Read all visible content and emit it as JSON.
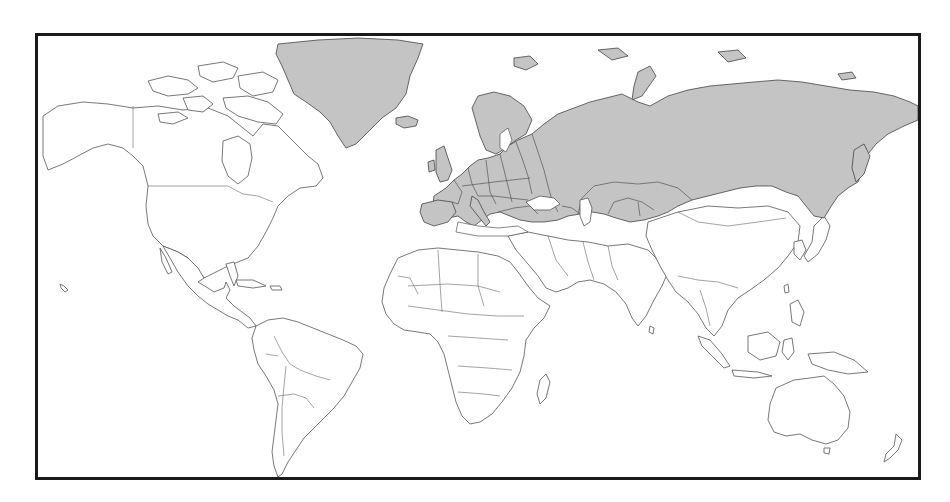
{
  "map": {
    "type": "world-political-outline",
    "projection": "miller-cylindrical",
    "colors": {
      "highlight_fill": "#c4c4c4",
      "default_fill": "#ffffff",
      "outline": "#555555",
      "frame_border": "#1a1a1a"
    },
    "highlighted_regions": [
      "Greenland",
      "Iceland",
      "Europe",
      "Russia",
      "Turkey",
      "Caucasus",
      "Kazakhstan",
      "Uzbekistan",
      "Turkmenistan",
      "Kyrgyzstan",
      "Tajikistan"
    ],
    "unhighlighted_regions": [
      "North America",
      "Central America",
      "Caribbean",
      "South America",
      "Africa",
      "Middle East",
      "South Asia",
      "China",
      "Mongolia",
      "East Asia",
      "Southeast Asia",
      "Australia",
      "New Zealand"
    ],
    "description": "World map with Greenland, Europe, Russia, Turkey and Central Asia shaded gray"
  }
}
